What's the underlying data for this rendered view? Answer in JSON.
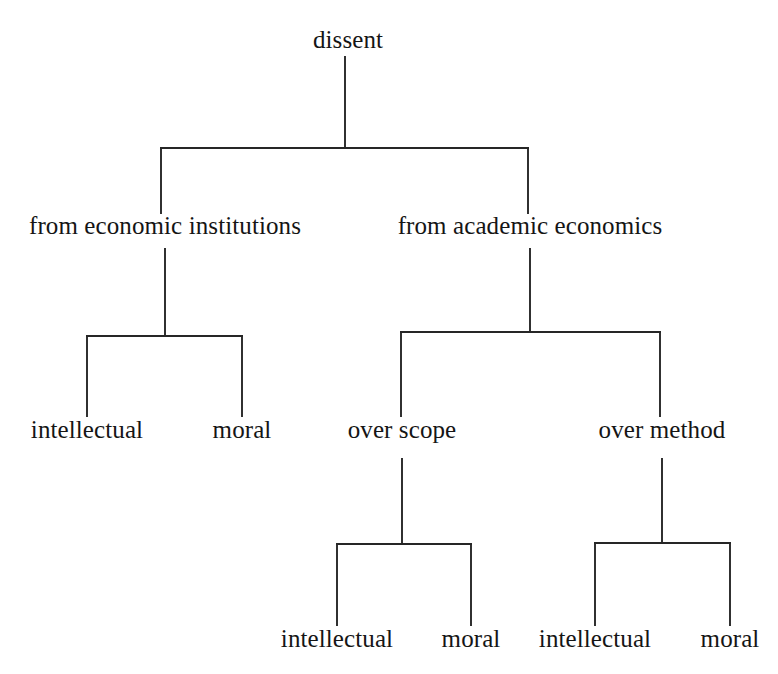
{
  "diagram": {
    "type": "tree",
    "title": "dissent",
    "orientation": "top-down",
    "line_color": "#262626",
    "text_color": "#151515",
    "background_color": "#ffffff",
    "nodes": {
      "root": {
        "label": "dissent",
        "x": 348,
        "y": 46
      },
      "economic_institutions": {
        "label": "from economic institutions",
        "x": 165,
        "y": 232
      },
      "academic_economics": {
        "label": "from academic economics",
        "x": 530,
        "y": 232
      },
      "ei_intellectual": {
        "label": "intellectual",
        "x": 87,
        "y": 436
      },
      "ei_moral": {
        "label": "moral",
        "x": 242,
        "y": 436
      },
      "over_scope": {
        "label": "over scope",
        "x": 402,
        "y": 436
      },
      "over_method": {
        "label": "over method",
        "x": 662,
        "y": 436
      },
      "scope_intellectual": {
        "label": "intellectual",
        "x": 337,
        "y": 645
      },
      "scope_moral": {
        "label": "moral",
        "x": 471,
        "y": 645
      },
      "method_intellectual": {
        "label": "intellectual",
        "x": 595,
        "y": 645
      },
      "method_moral": {
        "label": "moral",
        "x": 730,
        "y": 645
      }
    },
    "edges": [
      {
        "from": "root",
        "to": "economic_institutions"
      },
      {
        "from": "root",
        "to": "academic_economics"
      },
      {
        "from": "economic_institutions",
        "to": "ei_intellectual"
      },
      {
        "from": "economic_institutions",
        "to": "ei_moral"
      },
      {
        "from": "academic_economics",
        "to": "over_scope"
      },
      {
        "from": "academic_economics",
        "to": "over_method"
      },
      {
        "from": "over_scope",
        "to": "scope_intellectual"
      },
      {
        "from": "over_scope",
        "to": "scope_moral"
      },
      {
        "from": "over_method",
        "to": "method_intellectual"
      },
      {
        "from": "over_method",
        "to": "method_moral"
      }
    ]
  },
  "connectors": {
    "root_branch": {
      "stem_x": 345,
      "stem_top": 57,
      "bar_y": 148,
      "left_x": 161,
      "right_x": 528,
      "drop_bottom": 213
    },
    "left_branch": {
      "stem_x": 165,
      "stem_top": 249,
      "bar_y": 336,
      "left_x": 87,
      "right_x": 242,
      "drop_bottom": 416
    },
    "right_branch": {
      "stem_x": 530,
      "stem_top": 249,
      "bar_y": 332,
      "left_x": 401,
      "right_x": 660,
      "drop_bottom": 416
    },
    "scope_branch": {
      "stem_x": 402,
      "stem_top": 459,
      "bar_y": 544,
      "left_x": 337,
      "right_x": 471,
      "drop_bottom": 625
    },
    "method_branch": {
      "stem_x": 662,
      "stem_top": 459,
      "bar_y": 543,
      "left_x": 595,
      "right_x": 730,
      "drop_bottom": 625
    }
  }
}
